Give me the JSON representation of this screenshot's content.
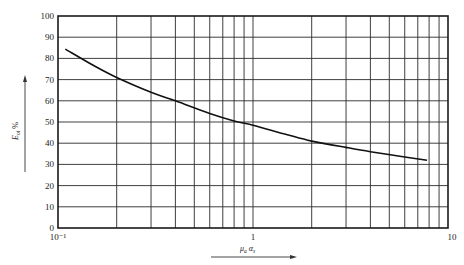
{
  "chart_data": {
    "type": "line",
    "title": "",
    "xlabel": "μa αs",
    "xlabel_parts": {
      "main1": "μ",
      "sub1": "a",
      "main2": "α",
      "sub2": "s"
    },
    "ylabel": "Eot %",
    "ylabel_parts": {
      "main": "E",
      "sub": "ot",
      "unit": "%"
    },
    "x_scale": "log",
    "xlim": [
      0.1,
      10
    ],
    "ylim": [
      0,
      100
    ],
    "x_tick_labels": [
      "10⁻¹",
      "1",
      "10"
    ],
    "x_tick_values": [
      0.1,
      1,
      10
    ],
    "y_tick_labels": [
      "0",
      "10",
      "20",
      "30",
      "40",
      "50",
      "60",
      "70",
      "80",
      "90",
      "100"
    ],
    "y_tick_values": [
      0,
      10,
      20,
      30,
      40,
      50,
      60,
      70,
      80,
      90,
      100
    ],
    "grid": true,
    "legend": null,
    "series": [
      {
        "name": "Eot",
        "x": [
          0.109,
          0.15,
          0.2,
          0.3,
          0.4,
          0.6,
          0.8,
          1.0,
          1.5,
          2.0,
          3.0,
          4.0,
          6.0,
          7.8
        ],
        "y": [
          84.4,
          77,
          71,
          64,
          60,
          54,
          50.5,
          48.5,
          44,
          41,
          38,
          36,
          33.5,
          32
        ]
      }
    ]
  }
}
